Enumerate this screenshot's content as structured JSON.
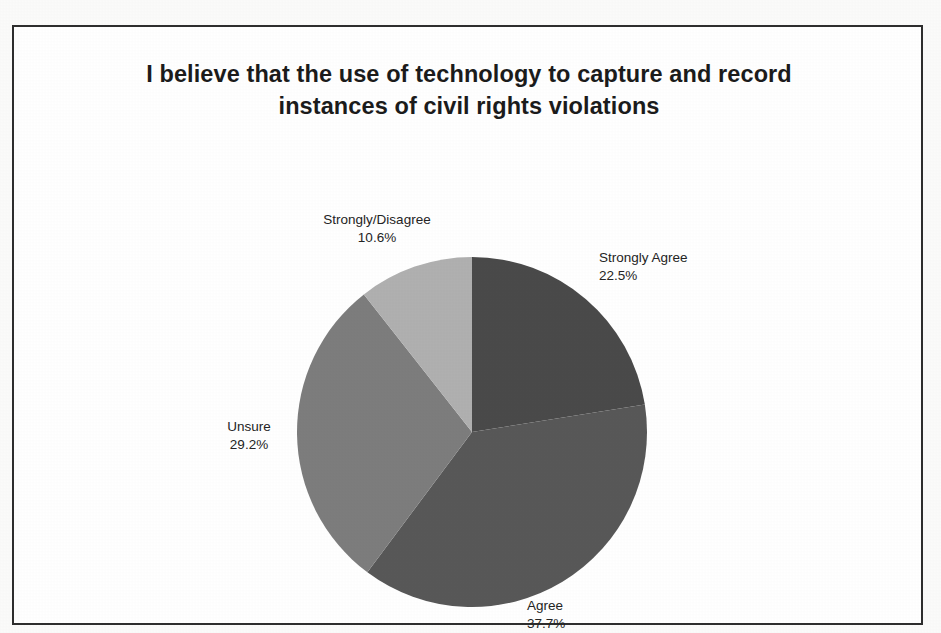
{
  "document": {
    "kind": "scanned-slide",
    "page_background": "#fbfbfa",
    "frame_border_color": "#2e2e2e"
  },
  "chart_data": {
    "type": "pie",
    "title": "I believe that the use of technology to capture and record instances of civil rights violations",
    "title_line1": "I believe that the use of technology to capture and record",
    "title_line2": "instances of civil rights violations",
    "xlabel": "",
    "ylabel": "",
    "grid": false,
    "legend": "none",
    "labels_position": "outside",
    "start_angle_deg": 0,
    "direction": "clockwise",
    "categories": [
      "Strongly Agree",
      "Agree",
      "Unsure",
      "Strongly/Disagree"
    ],
    "values": [
      22.5,
      37.7,
      29.2,
      10.6
    ],
    "value_suffix": "%",
    "colors": [
      "#4a4a4a",
      "#585858",
      "#7d7d7d",
      "#b0b0b0"
    ],
    "slices": [
      {
        "label": "Strongly Agree",
        "percent": 22.5,
        "percent_text": "22.5%",
        "color": "#4a4a4a",
        "start_deg": 0.0,
        "end_deg": 81.0
      },
      {
        "label": "Agree",
        "percent": 37.7,
        "percent_text": "37.7%",
        "color": "#585858",
        "start_deg": 81.0,
        "end_deg": 216.7
      },
      {
        "label": "Unsure",
        "percent": 29.2,
        "percent_text": "29.2%",
        "color": "#7d7d7d",
        "start_deg": 216.7,
        "end_deg": 321.8
      },
      {
        "label": "Strongly/Disagree",
        "percent": 10.6,
        "percent_text": "10.6%",
        "color": "#b0b0b0",
        "start_deg": 321.8,
        "end_deg": 360.0
      }
    ]
  },
  "labels": {
    "strongly_disagree": {
      "name": "Strongly/Disagree",
      "percent": "10.6%"
    },
    "strongly_agree": {
      "name": "Strongly Agree",
      "percent": "22.5%"
    },
    "unsure": {
      "name": "Unsure",
      "percent": "29.2%"
    },
    "agree": {
      "name": "Agree",
      "percent": "37.7%"
    }
  }
}
